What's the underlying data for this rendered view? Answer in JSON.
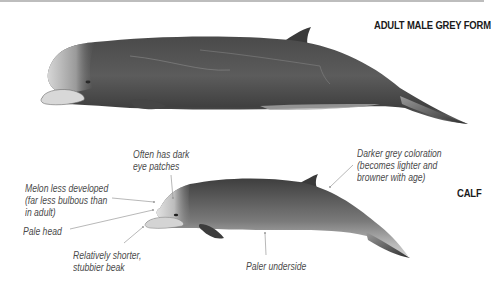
{
  "titles": {
    "adult": "ADULT MALE GREY FORM",
    "calf": "CALF"
  },
  "annotations": {
    "eye_patches": [
      "Often has dark",
      "eye patches"
    ],
    "melon": [
      "Melon less developed",
      "(far less bulbous than",
      "in adult)"
    ],
    "pale_head": "Pale head",
    "beak": [
      "Relatively shorter,",
      "stubbier beak"
    ],
    "underside": "Paler underside",
    "coloration": [
      "Darker grey coloration",
      "(becomes lighter and",
      "browner with age)"
    ]
  },
  "colors": {
    "whale_dark": "#3a3a3a",
    "whale_mid": "#6e6e6e",
    "whale_light": "#c8c8c8",
    "label_text": "#4a4a4a",
    "leader_line": "#9a9a9a"
  }
}
